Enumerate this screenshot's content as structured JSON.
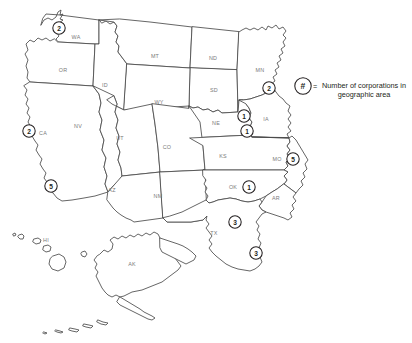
{
  "map": {
    "title": "Western United States corporation distribution map",
    "background_color": "#ffffff",
    "border_color": "#4a4a4a",
    "label_color": "#7a7a7a",
    "marker_color": "#231f20",
    "state_labels": [
      {
        "code": "WA",
        "x": 76,
        "y": 37
      },
      {
        "code": "OR",
        "x": 63,
        "y": 70
      },
      {
        "code": "ID",
        "x": 105,
        "y": 85
      },
      {
        "code": "MT",
        "x": 155,
        "y": 56
      },
      {
        "code": "ND",
        "x": 213,
        "y": 58
      },
      {
        "code": "MN",
        "x": 260,
        "y": 70
      },
      {
        "code": "SD",
        "x": 214,
        "y": 90
      },
      {
        "code": "WY",
        "x": 159,
        "y": 102
      },
      {
        "code": "NE",
        "x": 216,
        "y": 123
      },
      {
        "code": "IA",
        "x": 266,
        "y": 119
      },
      {
        "code": "CA",
        "x": 43,
        "y": 133
      },
      {
        "code": "NV",
        "x": 78,
        "y": 126
      },
      {
        "code": "UT",
        "x": 120,
        "y": 138
      },
      {
        "code": "CO",
        "x": 167,
        "y": 147
      },
      {
        "code": "KS",
        "x": 223,
        "y": 156
      },
      {
        "code": "MO",
        "x": 277,
        "y": 159
      },
      {
        "code": "AZ",
        "x": 112,
        "y": 190
      },
      {
        "code": "NM",
        "x": 158,
        "y": 196
      },
      {
        "code": "OK",
        "x": 233,
        "y": 187
      },
      {
        "code": "AR",
        "x": 276,
        "y": 198
      },
      {
        "code": "TX",
        "x": 214,
        "y": 233
      },
      {
        "code": "HI",
        "x": 46,
        "y": 240
      },
      {
        "code": "AK",
        "x": 132,
        "y": 264
      }
    ],
    "markers": [
      {
        "id": "marker-wa",
        "state": "WA",
        "value": "2",
        "x": 59,
        "y": 28
      },
      {
        "id": "marker-ca-north",
        "state": "CA",
        "value": "2",
        "x": 29,
        "y": 131
      },
      {
        "id": "marker-ca-south",
        "state": "CA",
        "value": "5",
        "x": 51,
        "y": 186
      },
      {
        "id": "marker-mn",
        "state": "MN",
        "value": "2",
        "x": 269,
        "y": 88
      },
      {
        "id": "marker-ne-upper",
        "state": "NE",
        "value": "1",
        "x": 244,
        "y": 116
      },
      {
        "id": "marker-ne-lower",
        "state": "NE",
        "value": "1",
        "x": 247,
        "y": 131
      },
      {
        "id": "marker-mo",
        "state": "MO",
        "value": "5",
        "x": 293,
        "y": 159
      },
      {
        "id": "marker-ok",
        "state": "OK",
        "value": "1",
        "x": 249,
        "y": 187
      },
      {
        "id": "marker-tx-north",
        "state": "TX",
        "value": "3",
        "x": 235,
        "y": 222
      },
      {
        "id": "marker-tx-south",
        "state": "TX",
        "value": "3",
        "x": 256,
        "y": 253
      }
    ]
  },
  "legend": {
    "symbol": "#",
    "equals_sign": "=",
    "description_line1": "Number of corporations in",
    "description_line2": "geographic area",
    "description_full": "= Number of corporations in geographic area",
    "symbol_x": 303,
    "symbol_y": 86
  }
}
